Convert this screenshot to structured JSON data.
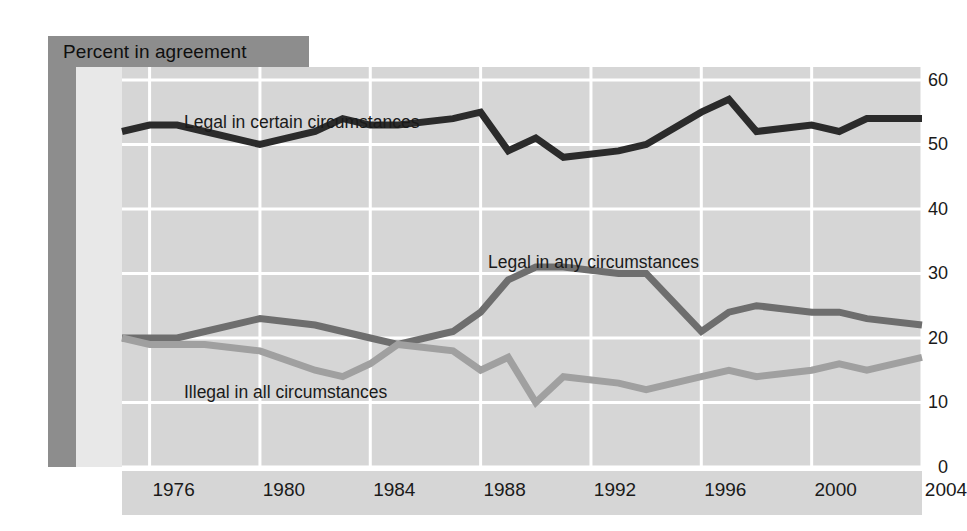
{
  "title": "Percent in agreement",
  "colors": {
    "panel_background": "#d6d6d6",
    "band": "#8d8d8d",
    "gridline": "#ffffff",
    "legal_certain": "#2b2b2b",
    "legal_any": "#6e6e6e",
    "illegal_all": "#a0a0a0"
  },
  "axis": {
    "y_ticks": [
      "0",
      "10",
      "20",
      "30",
      "40",
      "50",
      "60"
    ],
    "x_ticks": [
      "1976",
      "1980",
      "1984",
      "1988",
      "1992",
      "1996",
      "2000",
      "2004"
    ]
  },
  "labels": {
    "legal_certain": "Legal in certain circumstances",
    "legal_any": "Legal in any circumstances",
    "illegal_all": "Illegal in all circumstances"
  },
  "chart_data": {
    "type": "line",
    "title": "Percent in agreement",
    "xlabel": "",
    "ylabel": "Percent in agreement",
    "xlim": [
      1975,
      2004
    ],
    "ylim": [
      0,
      62
    ],
    "yticks": [
      0,
      10,
      20,
      30,
      40,
      50,
      60
    ],
    "xticks": [
      1976,
      1980,
      1984,
      1988,
      1992,
      1996,
      2000,
      2004
    ],
    "grid": true,
    "legend": "inline annotations",
    "x": [
      1975,
      1976,
      1977,
      1978,
      1980,
      1982,
      1983,
      1984,
      1985,
      1987,
      1988,
      1989,
      1990,
      1991,
      1993,
      1994,
      1996,
      1997,
      1998,
      2000,
      2001,
      2002,
      2004
    ],
    "series": [
      {
        "name": "Legal in certain circumstances",
        "color": "#2b2b2b",
        "values": [
          52,
          53,
          53,
          52,
          50,
          52,
          54,
          53,
          53,
          54,
          55,
          49,
          51,
          48,
          49,
          50,
          55,
          57,
          52,
          53,
          52,
          54,
          54
        ]
      },
      {
        "name": "Legal in any circumstances",
        "color": "#6e6e6e",
        "values": [
          20,
          20,
          20,
          21,
          23,
          22,
          21,
          20,
          19,
          21,
          24,
          29,
          31,
          31,
          30,
          30,
          21,
          24,
          25,
          24,
          24,
          23,
          22
        ]
      },
      {
        "name": "Illegal in all circumstances",
        "color": "#a0a0a0",
        "values": [
          20,
          19,
          19,
          19,
          18,
          15,
          14,
          16,
          19,
          18,
          15,
          17,
          10,
          14,
          13,
          12,
          14,
          15,
          14,
          15,
          16,
          15,
          17
        ]
      }
    ]
  }
}
